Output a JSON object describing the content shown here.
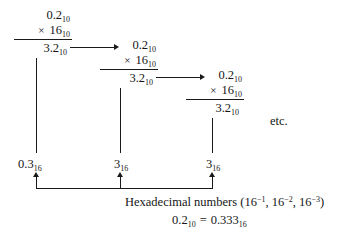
{
  "figure": {
    "name": "decimal-to-hexadecimal-fraction-conversion",
    "etc_label": "etc.",
    "ink_color": "#1a1a1a"
  },
  "steps": [
    {
      "id": "step-1",
      "operand": "0.2",
      "operand_sub": "10",
      "times_symbol": "×",
      "multiplier": "16",
      "multiplier_sub": "10",
      "product": "3.2",
      "product_sub": "10",
      "extracted_digit": "0.3",
      "extracted_digit_sub": "16"
    },
    {
      "id": "step-2",
      "operand": "0.2",
      "operand_sub": "10",
      "times_symbol": "×",
      "multiplier": "16",
      "multiplier_sub": "10",
      "product": "3.2",
      "product_sub": "10",
      "extracted_digit": "3",
      "extracted_digit_sub": "16"
    },
    {
      "id": "step-3",
      "operand": "0.2",
      "operand_sub": "10",
      "times_symbol": "×",
      "multiplier": "16",
      "multiplier_sub": "10",
      "product": "3.2",
      "product_sub": "10",
      "extracted_digit": "3",
      "extracted_digit_sub": "16"
    }
  ],
  "caption": {
    "line1_text": "Hexadecimal numbers (16",
    "line1_exp1": "−1",
    "line1_mid1": ", 16",
    "line1_exp2": "−2",
    "line1_mid2": ", 16",
    "line1_exp3": "−3",
    "line1_end": ")",
    "line2_lhs": "0.2",
    "line2_lhs_sub": "10",
    "line2_equals": "=",
    "line2_rhs": "0.333",
    "line2_rhs_sub": "16"
  }
}
